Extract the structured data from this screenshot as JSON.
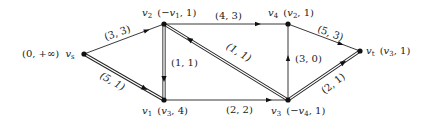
{
  "diagram": {
    "type": "network-flow-labeling",
    "nodes": [
      {
        "id": "vs",
        "name": "v_s",
        "label": "(0, +∞)",
        "x": 84,
        "y": 54
      },
      {
        "id": "v2",
        "name": "v_2",
        "label": "(-v_1, 1)",
        "x": 164,
        "y": 24
      },
      {
        "id": "v1",
        "name": "v_1",
        "label": "(v_3, 4)",
        "x": 164,
        "y": 100
      },
      {
        "id": "v4",
        "name": "v_4",
        "label": "(v_2, 1)",
        "x": 288,
        "y": 24
      },
      {
        "id": "v3",
        "name": "v_3",
        "label": "(-v_4, 1)",
        "x": 288,
        "y": 100
      },
      {
        "id": "vt",
        "name": "v_t",
        "label": "(v_3, 1)",
        "x": 360,
        "y": 51
      }
    ],
    "edges": [
      {
        "from": "vs",
        "to": "v2",
        "label": "(3, 3)",
        "style": "single"
      },
      {
        "from": "vs",
        "to": "v1",
        "label": "(5, 1)",
        "style": "double"
      },
      {
        "from": "v2",
        "to": "v1",
        "label": "(1, 1)",
        "style": "double"
      },
      {
        "from": "v2",
        "to": "v4",
        "label": "(4, 3)",
        "style": "single"
      },
      {
        "from": "v3",
        "to": "v2",
        "label": "(1, 1)",
        "style": "double"
      },
      {
        "from": "v1",
        "to": "v3",
        "label": "(2, 2)",
        "style": "single"
      },
      {
        "from": "v3",
        "to": "v4",
        "label": "(3, 0)",
        "style": "single"
      },
      {
        "from": "v4",
        "to": "vt",
        "label": "(5, 3)",
        "style": "single"
      },
      {
        "from": "v3",
        "to": "vt",
        "label": "(2, 1)",
        "style": "double"
      }
    ]
  },
  "labels": {
    "vs": {
      "pre": "(0, +∞)",
      "name": "v",
      "sub": "s"
    },
    "v2": {
      "name": "v",
      "sub": "2",
      "pre": "(",
      "ref": "−v",
      "refsub": "1",
      "post": ", 1)"
    },
    "v1": {
      "name": "v",
      "sub": "1",
      "pre": "(",
      "ref": "v",
      "refsub": "3",
      "post": ", 4)"
    },
    "v4": {
      "name": "v",
      "sub": "4",
      "pre": "(",
      "ref": "v",
      "refsub": "2",
      "post": ", 1)"
    },
    "v3": {
      "name": "v",
      "sub": "3",
      "pre": "(",
      "ref": "−v",
      "refsub": "4",
      "post": ", 1)"
    },
    "vt": {
      "name": "v",
      "sub": "t",
      "pre": "(",
      "ref": "v",
      "refsub": "3",
      "post": ", 1)"
    }
  },
  "edge_labels": {
    "vs_v2": "(3, 3)",
    "vs_v1": "(5, 1)",
    "v2_v1": "(1, 1)",
    "v2_v4": "(4, 3)",
    "v3_v2": "(1, 1)",
    "v1_v3": "(2, 2)",
    "v3_v4": "(3, 0)",
    "v4_vt": "(5, 3)",
    "v3_vt": "(2, 1)"
  }
}
